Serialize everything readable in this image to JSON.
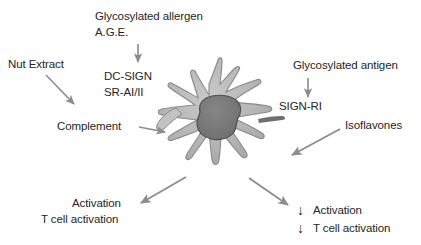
{
  "figure": {
    "background_color": "#ffffff",
    "text_color": "#262626",
    "arrow_color": "#8c8c8c",
    "cell": {
      "name": "dendritic-cell",
      "body_color": "#b4b4b4",
      "body_edge_color": "#8a8a8a",
      "nucleus_color": "#787878",
      "nucleus_edge_color": "#4d4d4d"
    }
  },
  "labels": {
    "nut_extract": "Nut Extract",
    "glycosylated_allergen": "Glycosylated allergen",
    "age": "A.G.E.",
    "dc_sign": "DC-SIGN",
    "sr_ai_ii": "SR-AI/II",
    "complement": "Complement",
    "glycosylated_antigen": "Glycosylated antigen",
    "sign_ri": "SIGN-RI",
    "isoflavones": "Isoflavones",
    "activation_left": "Activation",
    "t_cell_activation_left": "T cell activation",
    "activation_right": "Activation",
    "t_cell_activation_right": "T cell activation"
  },
  "icons": {
    "down_arrow_glyph": "↓",
    "down_arrow_1": "down-arrow-activation-icon",
    "down_arrow_2": "down-arrow-t-cell-activation-icon"
  },
  "arrows": [
    {
      "name": "arrow-age-to-receptors",
      "direction": "down"
    },
    {
      "name": "arrow-nut-extract-to-complement",
      "direction": "down-right"
    },
    {
      "name": "arrow-complement-to-cell",
      "direction": "right"
    },
    {
      "name": "arrow-glycosylated-antigen-to-sign-ri",
      "direction": "down"
    },
    {
      "name": "arrow-isoflavones-to-cell",
      "direction": "down-left"
    },
    {
      "name": "arrow-cell-to-activation-left",
      "direction": "down-left"
    },
    {
      "name": "arrow-cell-to-activation-right",
      "direction": "down-right"
    }
  ]
}
